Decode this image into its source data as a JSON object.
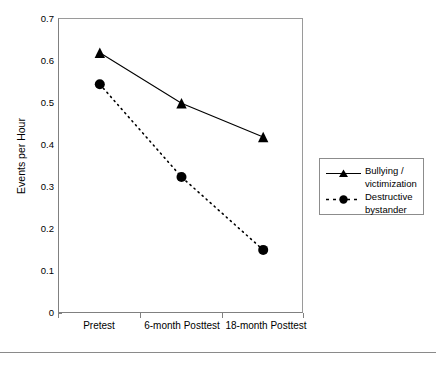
{
  "chart_data": {
    "type": "line",
    "title": "",
    "xlabel": "",
    "ylabel": "Events per Hour",
    "categories": [
      "Pretest",
      "6-month Posttest",
      "18-month Posttest"
    ],
    "ylim": [
      0,
      0.7
    ],
    "yticks": [
      "0",
      "0.1",
      "0.2",
      "0.3",
      "0.4",
      "0.5",
      "0.6",
      "0.7"
    ],
    "ytick_values": [
      0,
      0.1,
      0.2,
      0.3,
      0.4,
      0.5,
      0.6,
      0.7
    ],
    "grid": false,
    "legend_position": "right",
    "series": [
      {
        "name": "Bullying / victimization",
        "values": [
          0.62,
          0.5,
          0.42
        ],
        "marker": "triangle",
        "line_style": "solid",
        "color": "#000000"
      },
      {
        "name": "Destructive bystander",
        "values": [
          0.545,
          0.325,
          0.152
        ],
        "marker": "circle",
        "line_style": "dotted",
        "color": "#000000"
      }
    ]
  },
  "axis": {
    "y_title": "Events per Hour",
    "y_labels": {
      "t0": "0",
      "t1": "0.1",
      "t2": "0.2",
      "t3": "0.3",
      "t4": "0.4",
      "t5": "0.5",
      "t6": "0.6",
      "t7": "0.7"
    },
    "x_labels": {
      "c0": "Pretest",
      "c1": "6-month Posttest",
      "c2": "18-month Posttest"
    }
  },
  "legend": {
    "items": [
      {
        "label_line1": "Bullying /",
        "label_line2": "victimization",
        "marker": "triangle-marker",
        "style": "solid"
      },
      {
        "label_line1": "Destructive",
        "label_line2": "bystander",
        "marker": "circle-marker",
        "style": "dotted"
      }
    ]
  },
  "colors": {
    "ink": "#000000",
    "frame": "#808080",
    "rule": "#8a8a8a"
  }
}
